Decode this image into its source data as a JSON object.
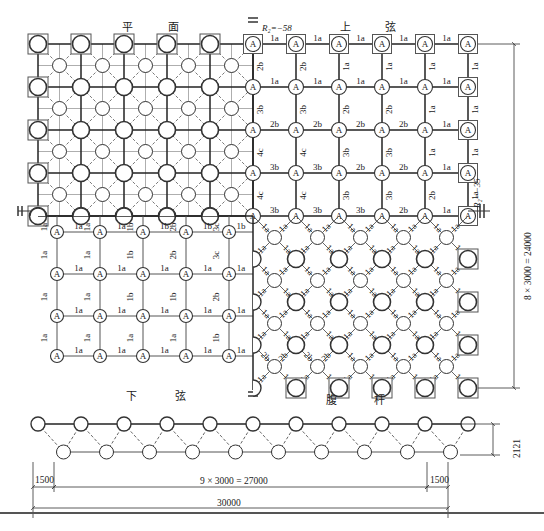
{
  "titles": {
    "plan": [
      "平",
      "面"
    ],
    "upper_chord": [
      "上",
      "弦"
    ],
    "lower_chord": [
      "下",
      "弦"
    ],
    "web": [
      "腹",
      "杆"
    ]
  },
  "reactions": {
    "top": "R₂=−58",
    "right": "R₂=−35"
  },
  "node_label": "A",
  "upper_chord": {
    "horizontal_rows": [
      [
        "1a",
        "1a",
        "1a",
        "1a",
        "1a"
      ],
      [
        "1a",
        "1a",
        "1a",
        "1a",
        "1a"
      ],
      [
        "2b",
        "2b",
        "2b",
        "2b",
        "1a"
      ],
      [
        "3b",
        "3b",
        "2b",
        "2b",
        "1a"
      ],
      [
        "3b",
        "3b",
        "3b",
        "2b",
        "1a"
      ]
    ],
    "vertical_rows": [
      [
        "2b",
        "2b",
        "1a",
        "1a",
        "1a",
        "1a"
      ],
      [
        "3b",
        "3b",
        "2b",
        "2b",
        "1a",
        "1a"
      ],
      [
        "4c",
        "4c",
        "3b",
        "3b",
        "1a",
        "1a"
      ],
      [
        "4c",
        "4c",
        "3b",
        "3b",
        "2b",
        "1a"
      ]
    ]
  },
  "lower_chord": {
    "top_verticals": [
      "1a",
      "1a",
      "1b",
      "2b",
      "3c"
    ],
    "horizontal_rows": [
      [
        "1a",
        "1a",
        "1b",
        "1b",
        "1b"
      ],
      [
        "1a",
        "1a",
        "1a",
        "1a",
        "1a"
      ],
      [
        "1a",
        "1a",
        "1a",
        "1a",
        "1a"
      ],
      [
        "1a",
        "1a",
        "1a",
        "1a",
        "1a"
      ]
    ],
    "vertical_rows": [
      [
        "1a",
        "1a",
        "1b",
        "2b",
        "3c"
      ],
      [
        "1a",
        "1a",
        "1b",
        "1b",
        "2b"
      ],
      [
        "1a",
        "1a",
        "1a",
        "1a",
        "1b"
      ]
    ]
  },
  "web": {
    "default_label": "1a",
    "special_label": "2b"
  },
  "dimensions": {
    "height_total": "8 × 3000 = 24000",
    "depth": "2121",
    "edge_left": "1500",
    "edge_right": "1500",
    "span_inner": "9 × 3000 = 27000",
    "span_total": "30000"
  }
}
